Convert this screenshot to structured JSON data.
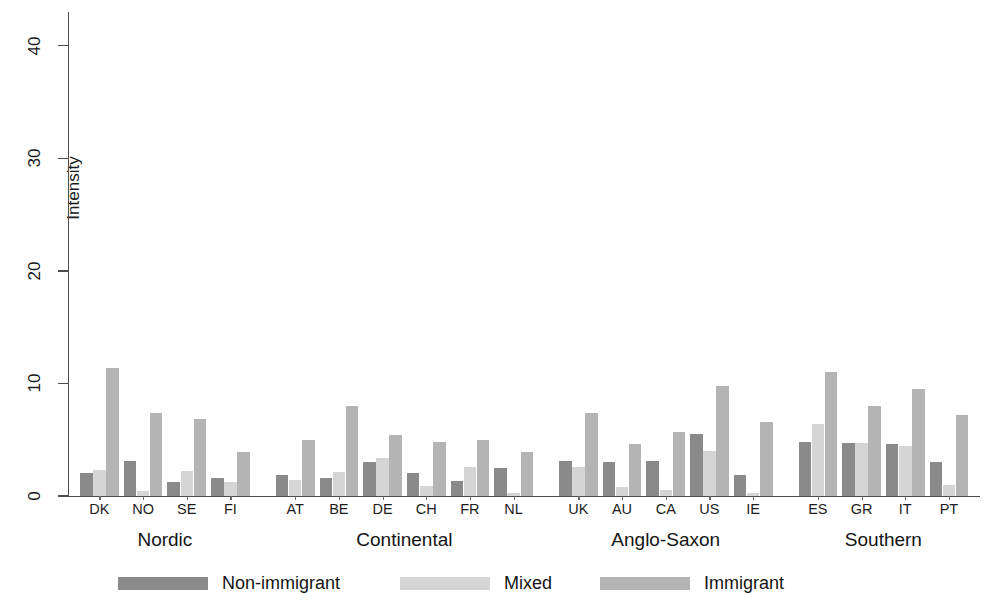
{
  "chart_data": {
    "type": "bar",
    "title": "",
    "subtitle": "",
    "xlabel": "",
    "ylabel": "Intensity",
    "ylim": [
      0,
      43
    ],
    "yticks": [
      0,
      10,
      20,
      30,
      40
    ],
    "ytick_labels": [
      "0",
      "10",
      "20",
      "30",
      "40"
    ],
    "grid": false,
    "legend_position": "bottom",
    "categories": [
      "DK",
      "NO",
      "SE",
      "FI",
      "AT",
      "BE",
      "DE",
      "CH",
      "FR",
      "NL",
      "UK",
      "AU",
      "CA",
      "US",
      "IE",
      "ES",
      "GR",
      "IT",
      "PT"
    ],
    "groups": [
      {
        "label": "Nordic",
        "categories": [
          "DK",
          "NO",
          "SE",
          "FI"
        ]
      },
      {
        "label": "Continental",
        "categories": [
          "AT",
          "BE",
          "DE",
          "CH",
          "FR",
          "NL"
        ]
      },
      {
        "label": "Anglo-Saxon",
        "categories": [
          "UK",
          "AU",
          "CA",
          "US",
          "IE"
        ]
      },
      {
        "label": "Southern",
        "categories": [
          "ES",
          "GR",
          "IT",
          "PT"
        ]
      }
    ],
    "series": [
      {
        "name": "Non-immigrant",
        "color": "#8a8a8a",
        "values": [
          2.0,
          3.1,
          1.2,
          1.6,
          1.9,
          1.6,
          3.0,
          2.0,
          1.3,
          2.5,
          3.1,
          3.0,
          3.1,
          5.5,
          1.9,
          4.8,
          4.7,
          4.6,
          3.0
        ]
      },
      {
        "name": "Mixed",
        "color": "#d5d5d5",
        "values": [
          2.3,
          0.4,
          2.2,
          1.2,
          1.4,
          2.1,
          3.4,
          0.9,
          2.6,
          0.3,
          2.6,
          0.8,
          0.5,
          4.0,
          0.3,
          6.4,
          4.7,
          4.4,
          1.0
        ]
      },
      {
        "name": "Immigrant",
        "color": "#b4b4b4",
        "values": [
          11.4,
          7.4,
          6.8,
          3.9,
          5.0,
          8.0,
          5.4,
          4.8,
          5.0,
          3.9,
          7.4,
          4.6,
          5.7,
          9.8,
          6.6,
          11.0,
          8.0,
          9.5,
          7.2
        ]
      }
    ]
  },
  "legend": {
    "items": [
      {
        "label": "Non-immigrant",
        "color": "#8a8a8a"
      },
      {
        "label": "Mixed",
        "color": "#d5d5d5"
      },
      {
        "label": "Immigrant",
        "color": "#b4b4b4"
      }
    ]
  },
  "axis": {
    "y_title": "Intensity"
  }
}
